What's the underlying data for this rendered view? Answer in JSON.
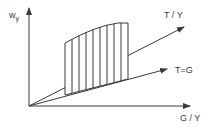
{
  "diagram": {
    "y_axis_label": "w",
    "y_axis_label_sub": "y",
    "x_axis_label": "G / Y",
    "upper_line_label": "T / Y",
    "lower_line_label": "T=G",
    "colors": {
      "line": "#3a3a3a",
      "background": "#ffffff"
    },
    "region": "hatched area between T/Y and T=G lines bounded above by curve"
  }
}
